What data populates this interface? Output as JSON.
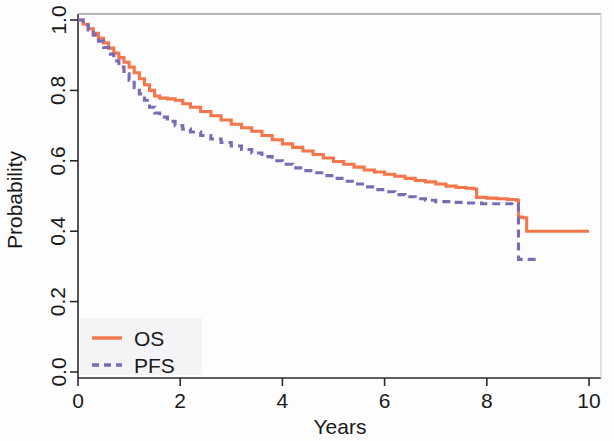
{
  "chart_data": {
    "type": "line",
    "title": "",
    "subtitle": "",
    "xlabel": "Years",
    "ylabel": "Probability",
    "xlim": [
      0,
      10.4
    ],
    "ylim": [
      0,
      1.0
    ],
    "xticks": [
      0,
      2,
      4,
      6,
      8,
      10
    ],
    "xticklabels": [
      "0",
      "2",
      "4",
      "6",
      "8",
      "10"
    ],
    "yticks": [
      0.0,
      0.2,
      0.4,
      0.6,
      0.8,
      1.0
    ],
    "yticklabels": [
      "0.0",
      "0.2",
      "0.4",
      "0.6",
      "0.8",
      "1.0"
    ],
    "grid": false,
    "legend_position": "bottom-left",
    "legend_entries": [
      "OS",
      "PFS"
    ],
    "series": [
      {
        "name": "OS",
        "label": "OS",
        "color": "#F4764A",
        "linestyle": "solid",
        "points": [
          [
            0.0,
            1.0
          ],
          [
            0.1,
            0.988
          ],
          [
            0.2,
            0.975
          ],
          [
            0.3,
            0.962
          ],
          [
            0.4,
            0.948
          ],
          [
            0.5,
            0.935
          ],
          [
            0.6,
            0.92
          ],
          [
            0.7,
            0.906
          ],
          [
            0.8,
            0.893
          ],
          [
            0.9,
            0.88
          ],
          [
            1.0,
            0.866
          ],
          [
            1.1,
            0.85
          ],
          [
            1.2,
            0.833
          ],
          [
            1.3,
            0.816
          ],
          [
            1.4,
            0.8
          ],
          [
            1.5,
            0.784
          ],
          [
            1.6,
            0.778
          ],
          [
            1.75,
            0.776
          ],
          [
            1.9,
            0.772
          ],
          [
            2.05,
            0.762
          ],
          [
            2.2,
            0.752
          ],
          [
            2.4,
            0.74
          ],
          [
            2.6,
            0.728
          ],
          [
            2.8,
            0.716
          ],
          [
            3.0,
            0.704
          ],
          [
            3.2,
            0.694
          ],
          [
            3.4,
            0.684
          ],
          [
            3.6,
            0.672
          ],
          [
            3.8,
            0.66
          ],
          [
            4.0,
            0.648
          ],
          [
            4.2,
            0.638
          ],
          [
            4.4,
            0.628
          ],
          [
            4.6,
            0.618
          ],
          [
            4.8,
            0.608
          ],
          [
            5.0,
            0.598
          ],
          [
            5.2,
            0.59
          ],
          [
            5.4,
            0.582
          ],
          [
            5.6,
            0.574
          ],
          [
            5.8,
            0.568
          ],
          [
            6.0,
            0.562
          ],
          [
            6.2,
            0.556
          ],
          [
            6.4,
            0.55
          ],
          [
            6.6,
            0.544
          ],
          [
            6.8,
            0.54
          ],
          [
            7.0,
            0.534
          ],
          [
            7.2,
            0.528
          ],
          [
            7.4,
            0.524
          ],
          [
            7.6,
            0.522
          ],
          [
            7.75,
            0.52
          ],
          [
            7.8,
            0.496
          ],
          [
            8.0,
            0.494
          ],
          [
            8.2,
            0.492
          ],
          [
            8.4,
            0.49
          ],
          [
            8.58,
            0.488
          ],
          [
            8.62,
            0.44
          ],
          [
            8.7,
            0.438
          ],
          [
            8.78,
            0.4
          ],
          [
            9.0,
            0.4
          ],
          [
            9.5,
            0.4
          ],
          [
            10.0,
            0.4
          ]
        ]
      },
      {
        "name": "PFS",
        "label": "PFS",
        "color": "#7B6BB5",
        "linestyle": "dashed",
        "points": [
          [
            0.0,
            1.0
          ],
          [
            0.1,
            0.986
          ],
          [
            0.2,
            0.972
          ],
          [
            0.3,
            0.957
          ],
          [
            0.4,
            0.94
          ],
          [
            0.5,
            0.922
          ],
          [
            0.6,
            0.903
          ],
          [
            0.7,
            0.884
          ],
          [
            0.8,
            0.866
          ],
          [
            0.9,
            0.847
          ],
          [
            1.0,
            0.828
          ],
          [
            1.1,
            0.808
          ],
          [
            1.2,
            0.79
          ],
          [
            1.3,
            0.772
          ],
          [
            1.4,
            0.752
          ],
          [
            1.5,
            0.736
          ],
          [
            1.6,
            0.724
          ],
          [
            1.75,
            0.712
          ],
          [
            1.9,
            0.7
          ],
          [
            2.05,
            0.69
          ],
          [
            2.2,
            0.682
          ],
          [
            2.4,
            0.672
          ],
          [
            2.6,
            0.662
          ],
          [
            2.8,
            0.652
          ],
          [
            3.0,
            0.642
          ],
          [
            3.2,
            0.632
          ],
          [
            3.4,
            0.622
          ],
          [
            3.6,
            0.612
          ],
          [
            3.8,
            0.6
          ],
          [
            4.0,
            0.59
          ],
          [
            4.2,
            0.58
          ],
          [
            4.4,
            0.572
          ],
          [
            4.6,
            0.566
          ],
          [
            4.8,
            0.558
          ],
          [
            5.0,
            0.55
          ],
          [
            5.2,
            0.542
          ],
          [
            5.4,
            0.534
          ],
          [
            5.6,
            0.526
          ],
          [
            5.8,
            0.518
          ],
          [
            6.0,
            0.512
          ],
          [
            6.2,
            0.504
          ],
          [
            6.4,
            0.498
          ],
          [
            6.6,
            0.492
          ],
          [
            6.8,
            0.488
          ],
          [
            7.0,
            0.484
          ],
          [
            7.3,
            0.482
          ],
          [
            7.6,
            0.48
          ],
          [
            7.9,
            0.478
          ],
          [
            8.2,
            0.478
          ],
          [
            8.45,
            0.478
          ],
          [
            8.58,
            0.478
          ],
          [
            8.62,
            0.32
          ],
          [
            8.8,
            0.32
          ],
          [
            9.0,
            0.32
          ]
        ]
      }
    ],
    "annotations": [
      {
        "text": "OS plateau near 1.4-1.9 years at ~0.78"
      },
      {
        "text": "Sharp drop for both curves at ~8.6 years"
      },
      {
        "text": "OS final probability ~0.40 at 10 years"
      },
      {
        "text": "PFS final probability ~0.32 at 9 years"
      }
    ]
  },
  "axes": {
    "x_title": "Years",
    "y_title": "Probability"
  },
  "legend": {
    "items": [
      {
        "label": "OS",
        "color": "#F4764A",
        "style": "solid"
      },
      {
        "label": "PFS",
        "color": "#7B6BB5",
        "style": "dashed"
      }
    ]
  },
  "colors": {
    "os": "#F4764A",
    "pfs": "#7B6BB5",
    "axis": "#2b2b2b",
    "background": "#fdfdfd",
    "legend_bg": "#f4f4f6"
  }
}
